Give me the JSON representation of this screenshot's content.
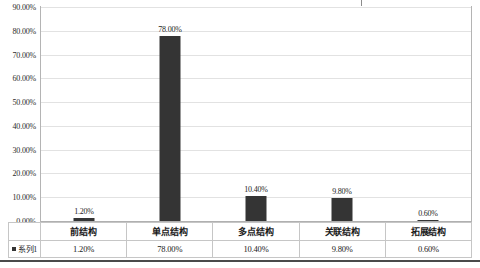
{
  "chart_data": {
    "type": "bar",
    "title": "",
    "subtitle": "",
    "xlabel": "",
    "ylabel": "",
    "categories": [
      "前结构",
      "单点结构",
      "多点结构",
      "关联结构",
      "拓展结构"
    ],
    "values": [
      1.2,
      78.0,
      10.4,
      9.8,
      0.6
    ],
    "value_labels": [
      "1.20%",
      "78.00%",
      "10.40%",
      "9.80%",
      "0.60%"
    ],
    "series": [
      {
        "name": "系列1",
        "values": [
          1.2,
          78.0,
          10.4,
          9.8,
          0.6
        ],
        "value_labels": [
          "1.20%",
          "78.00%",
          "10.40%",
          "9.80%",
          "0.60%"
        ],
        "color": "#343434"
      }
    ],
    "ylim": [
      0,
      90
    ],
    "ytick_step": 10,
    "ytick_labels": [
      "0.00%",
      "10.00%",
      "20.00%",
      "30.00%",
      "40.00%",
      "50.00%",
      "60.00%",
      "70.00%",
      "80.00%",
      "90.00%"
    ],
    "ytick_values": [
      0,
      10,
      20,
      30,
      40,
      50,
      60,
      70,
      80,
      90
    ],
    "grid": true,
    "grid_axis": "y",
    "legend_position": "data-table-left",
    "data_table_visible": true,
    "bar_color": "#343434",
    "gridline_color": "#e2e2e2",
    "frame_color": "#b4b4b4"
  },
  "data_table": {
    "legend_label": "系列1",
    "category_row": [
      "前结构",
      "单点结构",
      "多点结构",
      "关联结构",
      "拓展结构"
    ],
    "value_row": [
      "1.20%",
      "78.00%",
      "10.40%",
      "9.80%",
      "0.60%"
    ]
  }
}
